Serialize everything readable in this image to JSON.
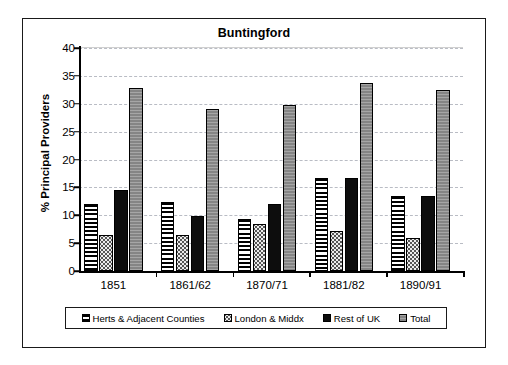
{
  "chart_data": {
    "type": "bar",
    "title": "Buntingford",
    "xlabel": "",
    "ylabel": "% Principal Providers",
    "ylim": [
      0,
      40
    ],
    "ytick_step": 5,
    "yticks": [
      0,
      5,
      10,
      15,
      20,
      25,
      30,
      35,
      40
    ],
    "grid": true,
    "legend_position": "bottom",
    "categories": [
      "1851",
      "1861/62",
      "1870/71",
      "1881/82",
      "1890/91"
    ],
    "series": [
      {
        "name": "Herts & Adjacent Counties",
        "pattern": "horizontal-stripes",
        "color": "#ffffff",
        "values": [
          12.0,
          12.4,
          9.4,
          16.6,
          13.4
        ]
      },
      {
        "name": "London & Middx",
        "pattern": "dotted",
        "color": "#ececec",
        "values": [
          6.4,
          6.5,
          8.5,
          7.1,
          5.9
        ]
      },
      {
        "name": "Rest of UK",
        "pattern": "solid",
        "color": "#0d0d0d",
        "values": [
          14.5,
          9.9,
          12.0,
          16.6,
          13.4
        ]
      },
      {
        "name": "Total",
        "pattern": "solid-gray",
        "color": "#8d8d8d",
        "values": [
          32.8,
          29.0,
          29.8,
          33.8,
          32.5
        ]
      }
    ]
  },
  "legend": {
    "items": [
      {
        "label": "Herts & Adjacent Counties"
      },
      {
        "label": "London & Middx"
      },
      {
        "label": "Rest of UK"
      },
      {
        "label": "Total"
      }
    ]
  },
  "colors": {
    "frame": "#1a1a1a",
    "gridline": "#b9bcc4",
    "axis": "#000000",
    "background": "#ffffff"
  }
}
